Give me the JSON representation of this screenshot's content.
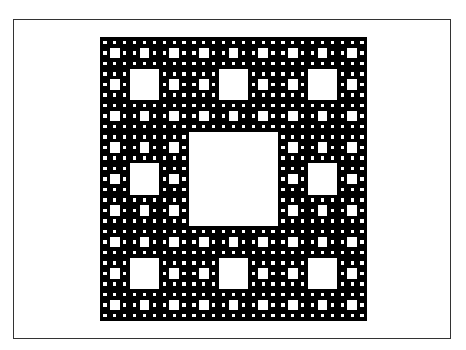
{
  "figure": {
    "fractal_level": 4,
    "colors": {
      "fill": "#000000",
      "hole": "#ffffff",
      "frame": "#333333",
      "background": "#ffffff"
    }
  }
}
